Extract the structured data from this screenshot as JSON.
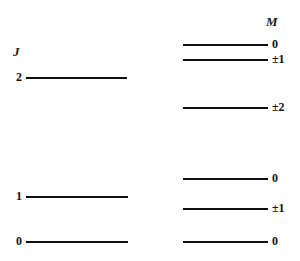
{
  "figure": {
    "type": "energy-level-diagram",
    "headers": {
      "left": "J",
      "right": "M"
    },
    "left_levels": [
      {
        "label": "2",
        "y": 77,
        "x_start": 26,
        "x_end": 127
      },
      {
        "label": "1",
        "y": 196,
        "x_start": 26,
        "x_end": 128
      },
      {
        "label": "0",
        "y": 241,
        "x_start": 26,
        "x_end": 128
      }
    ],
    "right_levels": [
      {
        "label": "0",
        "y": 44,
        "x_start": 183,
        "x_end": 268
      },
      {
        "label": "±1",
        "y": 59,
        "x_start": 183,
        "x_end": 268
      },
      {
        "label": "±2",
        "y": 107,
        "x_start": 183,
        "x_end": 268
      },
      {
        "label": "0",
        "y": 178,
        "x_start": 183,
        "x_end": 268
      },
      {
        "label": "±1",
        "y": 208,
        "x_start": 183,
        "x_end": 268
      },
      {
        "label": "0",
        "y": 241,
        "x_start": 183,
        "x_end": 268
      }
    ],
    "colors": {
      "line": "#101010",
      "text": "#131313",
      "background": "#ffffff"
    }
  },
  "chart_data": {
    "type": "table",
    "title": "",
    "xlabel": "",
    "ylabel": "",
    "columns": [
      "J",
      "M"
    ],
    "series": [
      {
        "name": "J",
        "categories": [
          "2",
          "1",
          "0"
        ],
        "values": [
          77,
          196,
          241
        ]
      },
      {
        "name": "M",
        "categories": [
          "0",
          "±1",
          "±2",
          "0",
          "±1",
          "0"
        ],
        "values": [
          44,
          59,
          107,
          178,
          208,
          241
        ]
      }
    ],
    "annotations": [
      "J = 2 manifold splits into M = 0, ±1, ±2",
      "J = 1 manifold splits into M = 0, ±1",
      "J = 0 manifold remains M = 0"
    ]
  }
}
